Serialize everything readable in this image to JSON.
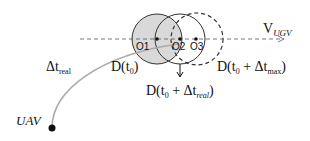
{
  "diagram": {
    "velocity_label": {
      "main": "V",
      "sub": "UGV"
    },
    "centers": [
      "O1",
      "O2",
      "O3"
    ],
    "delta_t_real": {
      "main": "Δt",
      "sub": "real"
    },
    "d_t0": {
      "pre": "D(t",
      "sub": "0",
      "post": ")"
    },
    "d_t0_max": {
      "pre": "D(t",
      "sub0": "0",
      "mid": " + Δt",
      "sub1": "max",
      "post": ")"
    },
    "d_t0_real": {
      "pre": "D(t",
      "sub0": "0",
      "mid": " + Δt",
      "sub1": "real",
      "post": ")"
    },
    "uav_label": "UAV",
    "colors": {
      "shaded_circle": "#d9d9d9",
      "stroke": "#333333",
      "trajectory": "#aaaaaa"
    }
  }
}
